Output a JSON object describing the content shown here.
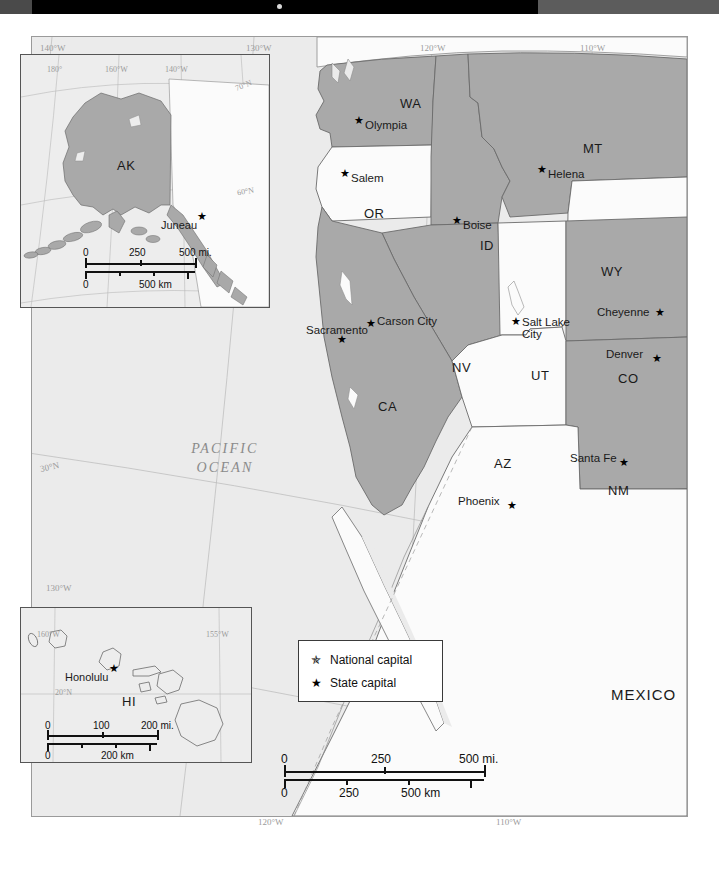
{
  "window": {
    "chrome_bar_color": "#000000",
    "background_color": "#ffffff"
  },
  "map": {
    "title": "Western United States",
    "ocean_label": "PACIFIC\nOCEAN",
    "ocean_label_line1": "PACIFIC",
    "ocean_label_line2": "OCEAN",
    "country_label_mexico": "MEXICO",
    "land_fill_highlight": "#a9a9a9",
    "land_fill_plain": "#f7f7f7",
    "ocean_fill": "#ebebeb",
    "border_color": "#6b6b6b"
  },
  "graticule": {
    "top": [
      {
        "label": "140°W",
        "x": 45,
        "y": 45
      },
      {
        "label": "130°W",
        "x": 248,
        "y": 45
      },
      {
        "label": "120°W",
        "x": 424,
        "y": 45
      },
      {
        "label": "110°W",
        "x": 583,
        "y": 45
      }
    ],
    "left": [
      {
        "label": "30°N",
        "x": 46,
        "y": 467
      },
      {
        "label": "130°W",
        "x": 52,
        "y": 588
      }
    ],
    "bottom": [
      {
        "label": "120°W",
        "x": 262,
        "y": 820
      },
      {
        "label": "110°W",
        "x": 500,
        "y": 820
      }
    ]
  },
  "states": [
    {
      "abbr": "WA",
      "x": 400,
      "y": 103,
      "shaded": true
    },
    {
      "abbr": "OR",
      "x": 371,
      "y": 212,
      "shaded": false
    },
    {
      "abbr": "ID",
      "x": 483,
      "y": 245,
      "shaded": true
    },
    {
      "abbr": "MT",
      "x": 588,
      "y": 148,
      "shaded": true
    },
    {
      "abbr": "WY",
      "x": 608,
      "y": 271,
      "shaded": false
    },
    {
      "abbr": "NV",
      "x": 458,
      "y": 367,
      "shaded": true
    },
    {
      "abbr": "UT",
      "x": 538,
      "y": 375,
      "shaded": false
    },
    {
      "abbr": "CO",
      "x": 625,
      "y": 378,
      "shaded": true
    },
    {
      "abbr": "CA",
      "x": 385,
      "y": 406,
      "shaded": true
    },
    {
      "abbr": "AZ",
      "x": 500,
      "y": 463,
      "shaded": false
    },
    {
      "abbr": "NM",
      "x": 615,
      "y": 490,
      "shaded": true
    }
  ],
  "capitals": [
    {
      "name": "Olympia",
      "label_x": 366,
      "label_y": 126,
      "star_x": 356,
      "star_y": 118,
      "anchor": "left"
    },
    {
      "name": "Salem",
      "label_x": 352,
      "label_y": 179,
      "star_x": 342,
      "star_y": 171,
      "anchor": "left"
    },
    {
      "name": "Boise",
      "label_x": 464,
      "label_y": 226,
      "star_x": 454,
      "star_y": 218,
      "anchor": "left"
    },
    {
      "name": "Helena",
      "label_x": 549,
      "label_y": 175,
      "star_x": 539,
      "star_y": 167,
      "anchor": "left"
    },
    {
      "name": "Cheyenne",
      "label_x": 598,
      "label_y": 313,
      "star_x": 656,
      "star_y": 309,
      "anchor": "left"
    },
    {
      "name": "Carson City",
      "label_x": 378,
      "label_y": 322,
      "star_x": 368,
      "star_y": 321,
      "anchor": "left"
    },
    {
      "name": "Sacramento",
      "label_x": 307,
      "label_y": 330,
      "star_x": 339,
      "star_y": 339,
      "anchor": "left"
    },
    {
      "name": "Salt Lake",
      "label_x": 523,
      "label_y": 323,
      "star_x": 513,
      "star_y": 320,
      "anchor": "left"
    },
    {
      "name": "City",
      "label_x": 523,
      "label_y": 334,
      "star_x": null,
      "star_y": null,
      "anchor": "left"
    },
    {
      "name": "Denver",
      "label_x": 607,
      "label_y": 355,
      "star_x": 653,
      "star_y": 355,
      "anchor": "left"
    },
    {
      "name": "Santa Fe",
      "label_x": 571,
      "label_y": 459,
      "star_x": 620,
      "star_y": 460,
      "anchor": "left"
    },
    {
      "name": "Phoenix",
      "label_x": 459,
      "label_y": 502,
      "star_x": 508,
      "star_y": 503,
      "anchor": "left"
    }
  ],
  "legend": {
    "title": "",
    "items": [
      {
        "symbol": "national",
        "label": "National capital"
      },
      {
        "symbol": "state",
        "label": "State capital"
      }
    ]
  },
  "main_scale": {
    "miles": {
      "ticks": [
        "0",
        "250",
        "500 mi."
      ]
    },
    "km": {
      "ticks": [
        "0",
        "250",
        "500 km"
      ]
    }
  },
  "inset_alaska": {
    "state_abbr": "AK",
    "capital": "Juneau",
    "graticule": [
      "180°",
      "160°W",
      "140°W",
      "70°N",
      "60°N"
    ],
    "scale": {
      "miles": [
        "0",
        "250",
        "500 mi."
      ],
      "km": [
        "0",
        "500 km"
      ]
    }
  },
  "inset_hawaii": {
    "state_abbr": "HI",
    "capital": "Honolulu",
    "graticule": [
      "160°W",
      "155°W",
      "20°N"
    ],
    "scale": {
      "miles": [
        "0",
        "100",
        "200 mi."
      ],
      "km": [
        "0",
        "200 km"
      ]
    }
  }
}
